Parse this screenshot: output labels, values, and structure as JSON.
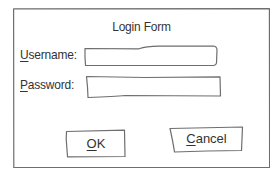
{
  "dialog": {
    "title": "Login Form"
  },
  "username": {
    "label_access_key": "U",
    "label_rest": "sername:",
    "value": ""
  },
  "password": {
    "label_access_key": "P",
    "label_rest": "assword:",
    "value": ""
  },
  "buttons": {
    "ok": {
      "access_key": "O",
      "rest": "K"
    },
    "cancel": {
      "access_key": "C",
      "rest": "ancel"
    }
  },
  "colors": {
    "line": "#6e6e6e",
    "text": "#333333",
    "background": "#ffffff"
  }
}
